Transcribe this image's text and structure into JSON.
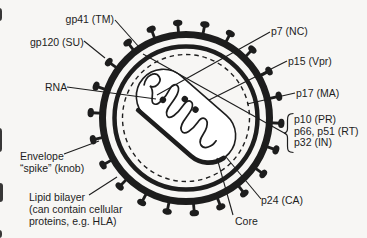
{
  "colors": {
    "background": "#f7f6f4",
    "ink": "#1d1d1d"
  },
  "diagram": "HIV virion cross-section",
  "labels": {
    "gp41": "gp41 (TM)",
    "gp120": "gp120 (SU)",
    "rna": "RNA",
    "p7": "p7 (NC)",
    "p15": "p15 (Vpr)",
    "p17": "p17 (MA)",
    "p10": "p10 (PR)",
    "p66_p51": "p66, p51 (RT)",
    "p32": "p32 (IN)",
    "p24": "p24 (CA)",
    "core": "Core",
    "envelope_spike": {
      "line1": "Envelope",
      "line2": "“spike” (knob)"
    },
    "lipid_bilayer": {
      "line1": "Lipid bilayer",
      "line2": "(can contain cellular",
      "line3": "proteins, e.g. HLA)"
    }
  }
}
